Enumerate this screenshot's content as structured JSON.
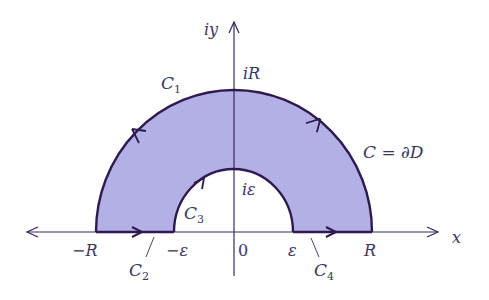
{
  "diagram": {
    "colors": {
      "fill": "#b3b0e6",
      "stroke": "#2e1a4e",
      "axis": "#3a2a5e",
      "text": "#3a3560"
    },
    "axes": {
      "x_label": "x",
      "y_label": "iy"
    },
    "labels": {
      "iR": "iR",
      "i_eps": "iε",
      "minus_R": "−R",
      "minus_eps": "−ε",
      "zero": "0",
      "eps": "ε",
      "R": "R",
      "boundary": "C = ∂D"
    },
    "contours": [
      {
        "name": "C",
        "sub": "1",
        "description": "outer semicircle of radius R"
      },
      {
        "name": "C",
        "sub": "2",
        "description": "segment from −R to −ε"
      },
      {
        "name": "C",
        "sub": "3",
        "description": "inner semicircle of radius ε"
      },
      {
        "name": "C",
        "sub": "4",
        "description": "segment from ε to R"
      }
    ]
  }
}
